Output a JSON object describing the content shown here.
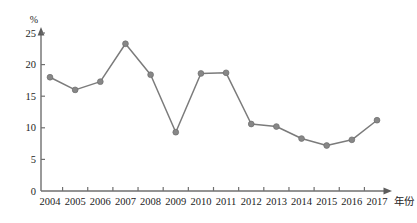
{
  "chart_data": {
    "type": "line",
    "title": "",
    "subtitle": "",
    "xlabel": "年份",
    "ylabel": "",
    "unit_label": "%",
    "categories": [
      "2004",
      "2005",
      "2006",
      "2007",
      "2008",
      "2009",
      "2010",
      "2011",
      "2012",
      "2013",
      "2014",
      "2015",
      "2016",
      "2017"
    ],
    "values": [
      18.0,
      16.0,
      17.3,
      23.3,
      18.4,
      9.3,
      18.6,
      18.7,
      10.6,
      10.2,
      8.3,
      7.2,
      8.1,
      11.2
    ],
    "series": [
      {
        "name": "",
        "values": [
          18.0,
          16.0,
          17.3,
          23.3,
          18.4,
          9.3,
          18.6,
          18.7,
          10.6,
          10.2,
          8.3,
          7.2,
          8.1,
          11.2
        ]
      }
    ],
    "ylim": [
      0,
      25
    ],
    "yticks": [
      0,
      5,
      10,
      15,
      20,
      25
    ],
    "ytick_labels": [
      "0",
      "5",
      "10",
      "15",
      "20",
      "25"
    ],
    "xtick_labels": [
      "2004",
      "2005",
      "2006",
      "2007",
      "2008",
      "2009",
      "2010",
      "2011",
      "2012",
      "2013",
      "2014",
      "2015",
      "2016",
      "2017"
    ],
    "grid": false,
    "legend": "none",
    "legend_position": "none",
    "marker": "circle",
    "line_color": "#7b7b7b",
    "marker_color": "#878787",
    "axis_color": "#6f6f6f",
    "background_color": "#ffffff"
  }
}
